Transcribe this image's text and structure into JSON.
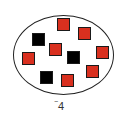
{
  "diagram": {
    "container": "ellipse",
    "colors": {
      "positive_tile": "#d9301f",
      "negative_tile": "#000000",
      "outline": "#222222"
    },
    "tiles": [
      {
        "color": "red",
        "x": 57,
        "y": 18
      },
      {
        "color": "red",
        "x": 78,
        "y": 27
      },
      {
        "color": "black",
        "x": 32,
        "y": 33
      },
      {
        "color": "red",
        "x": 49,
        "y": 43
      },
      {
        "color": "red",
        "x": 96,
        "y": 46
      },
      {
        "color": "black",
        "x": 67,
        "y": 51
      },
      {
        "color": "red",
        "x": 22,
        "y": 52
      },
      {
        "color": "red",
        "x": 86,
        "y": 65
      },
      {
        "color": "black",
        "x": 40,
        "y": 71
      },
      {
        "color": "red",
        "x": 61,
        "y": 74
      }
    ],
    "counts": {
      "red": 7,
      "black": 3
    },
    "label": {
      "sign": "−",
      "value": "4"
    }
  }
}
